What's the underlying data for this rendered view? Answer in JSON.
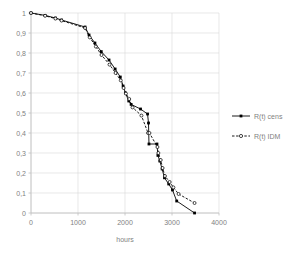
{
  "chart_data": {
    "type": "line",
    "title": "",
    "xlabel": "hours",
    "ylabel": "",
    "xlim": [
      0,
      4000
    ],
    "ylim": [
      0,
      1
    ],
    "grid": true,
    "legend_position": "right",
    "xticks": [
      0,
      1000,
      2000,
      3000,
      4000
    ],
    "xtick_labels": [
      "0",
      "1000",
      "2000",
      "3000",
      "4000"
    ],
    "yticks": [
      0,
      0.1,
      0.2,
      0.3,
      0.4,
      0.5,
      0.6,
      0.7,
      0.8,
      0.9,
      1
    ],
    "ytick_labels": [
      "0",
      "0,1",
      "0,2",
      "0,3",
      "0,4",
      "0,5",
      "0,6",
      "0,7",
      "0,8",
      "0,9",
      "1"
    ],
    "decimal_separator": ",",
    "series": [
      {
        "name": "R(t) cens",
        "line_style": "solid",
        "marker": "filled-square",
        "color": "#000000",
        "points": [
          [
            0,
            1.0
          ],
          [
            300,
            0.988
          ],
          [
            520,
            0.975
          ],
          [
            650,
            0.965
          ],
          [
            1150,
            0.93
          ],
          [
            1235,
            0.89
          ],
          [
            1360,
            0.85
          ],
          [
            1495,
            0.807
          ],
          [
            1660,
            0.765
          ],
          [
            1790,
            0.72
          ],
          [
            1900,
            0.68
          ],
          [
            1960,
            0.635
          ],
          [
            2010,
            0.6
          ],
          [
            2080,
            0.56
          ],
          [
            2130,
            0.543
          ],
          [
            2330,
            0.52
          ],
          [
            2480,
            0.495
          ],
          [
            2500,
            0.45
          ],
          [
            2510,
            0.345
          ],
          [
            2680,
            0.345
          ],
          [
            2700,
            0.288
          ],
          [
            2740,
            0.26
          ],
          [
            2790,
            0.22
          ],
          [
            2840,
            0.176
          ],
          [
            2930,
            0.145
          ],
          [
            3010,
            0.115
          ],
          [
            3100,
            0.06
          ],
          [
            3480,
            0.0
          ]
        ]
      },
      {
        "name": "R(t) IDM",
        "line_style": "dashed",
        "marker": "open-circle",
        "color": "#000000",
        "points": [
          [
            0,
            1.0
          ],
          [
            300,
            0.986
          ],
          [
            520,
            0.972
          ],
          [
            650,
            0.962
          ],
          [
            1150,
            0.925
          ],
          [
            1250,
            0.878
          ],
          [
            1380,
            0.832
          ],
          [
            1500,
            0.79
          ],
          [
            1670,
            0.742
          ],
          [
            1800,
            0.7
          ],
          [
            1910,
            0.663
          ],
          [
            1970,
            0.625
          ],
          [
            2020,
            0.597
          ],
          [
            2090,
            0.57
          ],
          [
            2160,
            0.528
          ],
          [
            2350,
            0.487
          ],
          [
            2490,
            0.4
          ],
          [
            2520,
            0.4
          ],
          [
            2690,
            0.33
          ],
          [
            2710,
            0.3
          ],
          [
            2760,
            0.265
          ],
          [
            2800,
            0.225
          ],
          [
            2850,
            0.185
          ],
          [
            2950,
            0.155
          ],
          [
            3030,
            0.128
          ],
          [
            3140,
            0.095
          ],
          [
            3480,
            0.05
          ]
        ]
      }
    ]
  },
  "legend": {
    "items": [
      {
        "label": "R(t) cens",
        "style": "solid",
        "marker": "filled-square"
      },
      {
        "label": "R(t) IDM",
        "style": "dashed",
        "marker": "open-circle"
      }
    ]
  },
  "axis": {
    "x_title": "hours"
  },
  "colors": {
    "line": "#000000",
    "grid": "#d9d9d9",
    "axis": "#bfbfbf",
    "text": "#7f7f7f",
    "background": "#ffffff"
  }
}
